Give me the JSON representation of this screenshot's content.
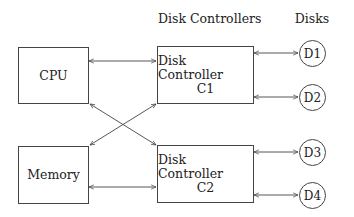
{
  "headers": {
    "controllers": "Disk Controllers",
    "disks": "Disks"
  },
  "nodes": {
    "cpu": "CPU",
    "memory": "Memory",
    "c1": {
      "line1": "Disk Controller",
      "line2": "C1"
    },
    "c2": {
      "line1": "Disk Controller",
      "line2": "C2"
    },
    "disks": [
      "D1",
      "D2",
      "D3",
      "D4"
    ]
  },
  "edges": [
    [
      "CPU",
      "C1"
    ],
    [
      "CPU",
      "C2"
    ],
    [
      "Memory",
      "C1"
    ],
    [
      "Memory",
      "C2"
    ],
    [
      "C1",
      "D1"
    ],
    [
      "C1",
      "D2"
    ],
    [
      "C2",
      "D3"
    ],
    [
      "C2",
      "D4"
    ]
  ]
}
